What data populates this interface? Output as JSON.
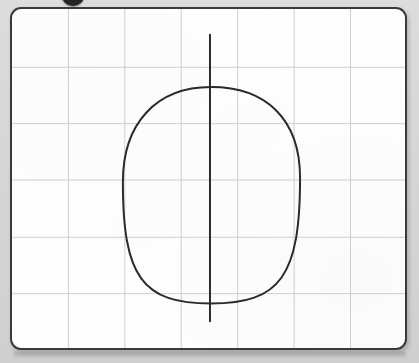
{
  "scene": {
    "title": "Whiteboard with grid and hand-drawn egg shape",
    "background_color": "#d9d9d9"
  },
  "top_object": {
    "name": "whiteboard-marker-cap",
    "color": "#242424",
    "description": "dark rounded object partially cut off at top edge"
  },
  "whiteboard": {
    "surface_color": "#fefefe",
    "frame_color": "#3a3a3c",
    "corner_radius": 11,
    "bounds": {
      "x": 10,
      "y": 7,
      "width": 397,
      "height": 343
    }
  },
  "grid": {
    "line_color": "#cfcfcf",
    "line_width": 1,
    "vertical_lines": [
      67,
      124,
      181,
      238,
      295,
      352
    ],
    "horizontal_lines": [
      66,
      123,
      180,
      238,
      295
    ],
    "columns": 7,
    "rows": 6,
    "cell_width": 57,
    "cell_height": 57
  },
  "chart_data": {
    "type": "scatter",
    "xlabel": "",
    "ylabel": "",
    "grid": true,
    "xlim": [
      10,
      407
    ],
    "ylim": [
      7,
      350
    ],
    "annotations": [
      "oval is taller than wide",
      "broader at top, tapering toward bottom",
      "vertical line extends above and below the oval"
    ],
    "series": [
      {
        "name": "egg-outline",
        "stroke": "#2a2a2a",
        "stroke_width": 2,
        "closed": true,
        "top_point": [
          211,
          86
        ],
        "bottom_point": [
          211,
          305
        ],
        "left_point": [
          122,
          182
        ],
        "right_point": [
          301,
          178
        ],
        "width": 179,
        "height": 219
      },
      {
        "name": "vertical-axis-line",
        "stroke": "#2a2a2a",
        "stroke_width": 2,
        "x": 210,
        "y_start": 33,
        "y_end": 323,
        "length": 290
      }
    ]
  },
  "drawing": {
    "ink_color": "#2a2a2a",
    "shapes": [
      {
        "label": "egg-outline",
        "kind": "closed-curve"
      },
      {
        "label": "vertical-axis-line",
        "kind": "straight-line"
      }
    ]
  }
}
